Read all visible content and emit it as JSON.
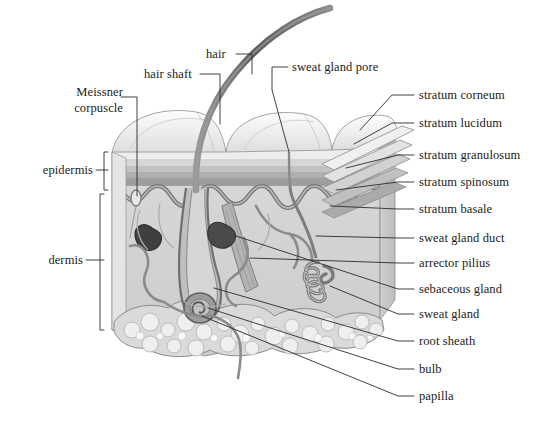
{
  "figure": {
    "background": "#ffffff",
    "ink": "#1b1b1b"
  },
  "palette": {
    "outline": "#6e6e6e",
    "dark_line": "#4a4a4a",
    "hair": "#7a7a7a",
    "hair_dark": "#585858",
    "epidermis_top": "#f2f2f2",
    "epidermis_band1": "#d8d8d8",
    "epidermis_band2": "#bdbdbd",
    "epidermis_band3": "#a8a8a8",
    "dermis_fill": "#d3d3d3",
    "dermis_side": "#c4c4c4",
    "fat_fill": "#dcdcdc",
    "fat_cell": "#eeeeee",
    "vessel": "#808080",
    "gland": "#8a8a8a",
    "leader": "#2b2b2b"
  },
  "labels": {
    "left": [
      {
        "id": "meissner-corpuscle",
        "text_line1": "Meissner",
        "text_line2": "corpuscle",
        "x": 55,
        "y": 90
      },
      {
        "id": "epidermis",
        "text": "epidermis",
        "x": 28,
        "y": 166
      },
      {
        "id": "dermis",
        "text": "dermis",
        "x": 27,
        "y": 256
      }
    ],
    "top": [
      {
        "id": "hair",
        "text": "hair",
        "x": 205,
        "y": 50
      },
      {
        "id": "hair-shaft",
        "text": "hair shaft",
        "x": 145,
        "y": 70
      },
      {
        "id": "sweat-gland-pore",
        "text": "sweat gland pore",
        "x": 292,
        "y": 63
      }
    ],
    "right": [
      {
        "id": "stratum-corneum",
        "text": "stratum corneum",
        "x": 417,
        "y": 91
      },
      {
        "id": "stratum-lucidum",
        "text": "stratum lucidum",
        "x": 417,
        "y": 119
      },
      {
        "id": "stratum-granulosum",
        "text": "stratum granulosum",
        "x": 417,
        "y": 151
      },
      {
        "id": "stratum-spinosum",
        "text": "stratum spinosum",
        "x": 417,
        "y": 178
      },
      {
        "id": "stratum-basale",
        "text": "stratum basale",
        "x": 417,
        "y": 205
      },
      {
        "id": "sweat-gland-duct",
        "text": "sweat gland duct",
        "x": 417,
        "y": 234
      },
      {
        "id": "arrector-pilius",
        "text": "arrector pilius",
        "x": 417,
        "y": 259
      },
      {
        "id": "sebaceous-gland",
        "text": "sebaceous gland",
        "x": 417,
        "y": 285
      },
      {
        "id": "sweat-gland",
        "text": "sweat gland",
        "x": 417,
        "y": 310
      },
      {
        "id": "root-sheath",
        "text": "root sheath",
        "x": 417,
        "y": 337
      },
      {
        "id": "bulb",
        "text": "bulb",
        "x": 417,
        "y": 365
      },
      {
        "id": "papilla",
        "text": "papilla",
        "x": 417,
        "y": 392
      }
    ]
  },
  "structures": {
    "layers": [
      {
        "name": "stratum corneum"
      },
      {
        "name": "stratum lucidum"
      },
      {
        "name": "stratum granulosum"
      },
      {
        "name": "stratum spinosum"
      },
      {
        "name": "stratum basale"
      }
    ],
    "regions": [
      "epidermis",
      "dermis",
      "subcutaneous fat"
    ],
    "appendages": [
      "hair",
      "hair shaft",
      "root sheath",
      "bulb",
      "papilla",
      "sebaceous gland",
      "sweat gland",
      "sweat gland duct",
      "sweat gland pore",
      "arrector pilius",
      "Meissner corpuscle"
    ]
  }
}
